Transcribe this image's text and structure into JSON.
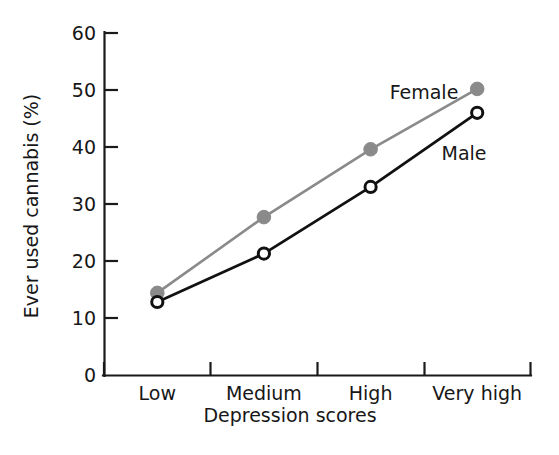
{
  "chart_data": {
    "type": "line",
    "title": "",
    "subtitle": "",
    "xlabel": "Depression scores",
    "ylabel": "Ever used cannabis (%)",
    "categories": [
      "Low",
      "Medium",
      "High",
      "Very high"
    ],
    "yticks": [
      0,
      10,
      20,
      30,
      40,
      50,
      60
    ],
    "ytick_labels": [
      "0",
      "10",
      "20",
      "30",
      "40",
      "50",
      "60"
    ],
    "ylim": [
      0,
      60
    ],
    "grid": false,
    "legend_position": "inline-annotation",
    "series": [
      {
        "name": "Female",
        "color": "#8a8a8a",
        "marker": "filled-circle",
        "values": [
          14.4,
          27.7,
          39.6,
          50.2
        ]
      },
      {
        "name": "Male",
        "color": "#111111",
        "marker": "open-circle",
        "values": [
          12.8,
          21.3,
          33.0,
          46.0
        ]
      }
    ],
    "annotations": [
      {
        "text": "Female",
        "series": "Female"
      },
      {
        "text": "Male",
        "series": "Male"
      }
    ]
  },
  "axes": {
    "y_tick_0": "0",
    "y_tick_1": "10",
    "y_tick_2": "20",
    "y_tick_3": "30",
    "y_tick_4": "40",
    "y_tick_5": "50",
    "y_tick_6": "60",
    "x_tick_0": "Low",
    "x_tick_1": "Medium",
    "x_tick_2": "High",
    "x_tick_3": "Very high",
    "x_axis_title": "Depression scores",
    "y_axis_title": "Ever used cannabis (%)"
  },
  "labels": {
    "female": "Female",
    "male": "Male"
  }
}
